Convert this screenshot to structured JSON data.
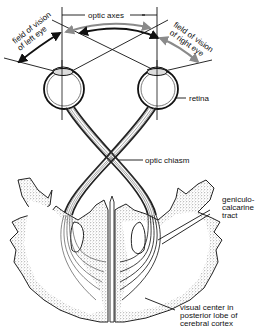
{
  "diagram": {
    "labels": {
      "optic_axes": "optic axes",
      "field_left_1": "field of vision",
      "field_left_2": "of left eye",
      "field_right_1": "field of vision",
      "field_right_2": "of right eye",
      "retina": "retina",
      "optic_chiasm": "optic chiasm",
      "geniculo_1": "geniculo-",
      "geniculo_2": "calcarine",
      "geniculo_3": "tract",
      "visual_center_1": "visual center in",
      "visual_center_2": "posterior lobe of",
      "visual_center_3": "cerebral cortex"
    },
    "colors": {
      "ink": "#111111",
      "gray_arrow": "#8a8a8a",
      "background": "#ffffff"
    }
  }
}
